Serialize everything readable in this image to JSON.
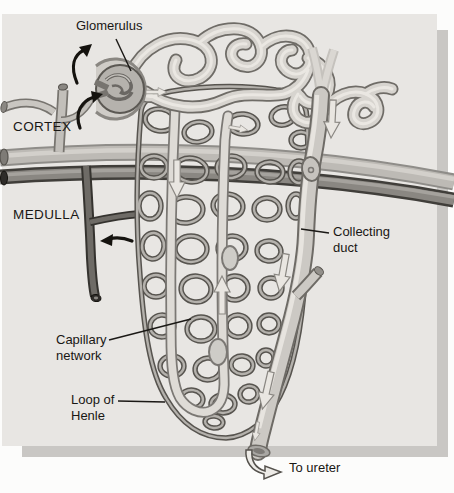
{
  "figure": {
    "regions": {
      "cortex": "CORTEX",
      "medulla": "MEDULLA"
    },
    "labels": {
      "glomerulus": "Glomerulus",
      "collecting_duct": "Collecting duct",
      "capillary_network": "Capillary network",
      "loop_of_henle": "Loop of Henle",
      "to_ureter": "To ureter"
    },
    "colors": {
      "page_background": "#fcfcfb",
      "panel_background": "#e8e6e3",
      "panel_shadow": "#c9c7c4",
      "ink": "#191714",
      "tubule_light": "#d7d4cf",
      "tubule_outline": "#6f6c67",
      "capillary_dark": "#57544f",
      "vein_dark": "#35332f",
      "artery_gray": "#bdbab5"
    }
  }
}
